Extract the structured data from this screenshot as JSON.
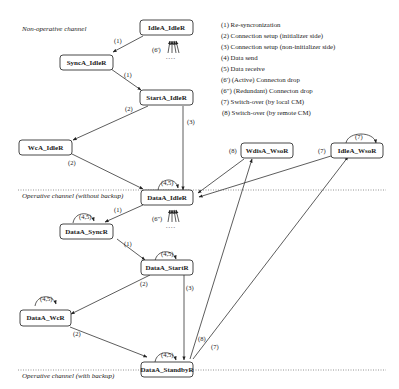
{
  "sections": {
    "non_operative": "Non-operative channel",
    "operative_without_backup": "Operative channel (without backup)",
    "operative_with_backup": "Operative channel  (with backup)"
  },
  "legend": [
    "(1) Re-syncronization",
    "(2) Connection setup (initializer side)",
    "(3) Connection setup  (non-initializer side)",
    "(4) Data send",
    "(5) Data receive",
    "(6') (Active) Connecton drop",
    "(6\") (Redundant) Connecton drop",
    "(7) Switch-over (by local CM)",
    "(8) Switch-over (by remote CM)"
  ],
  "nodes": {
    "idlea_idler": "IdleA_IdleR",
    "synca_idler": "SyncA_IdleR",
    "starta_idler": "StartA_IdleR",
    "wca_idler": "WcA_IdleR",
    "wdisa_wsor": "WdisA_WsoR",
    "idlea_wsor": "IdleA_WsoR",
    "dataa_idler": "DataA_IdleR",
    "dataa_syncr": "DataA_SyncR",
    "dataa_startr": "DataA_StartR",
    "dataa_wcr": "DataA_WcR",
    "dataa_standbyr": "DataA_StandbyR"
  },
  "edge_labels": {
    "idle_to_sync": "(1)",
    "sync_to_start": "(1)",
    "start_to_wc": "(2)",
    "start_to_data": "(3)",
    "wc_to_data": "(2)",
    "drop_active": "(6')",
    "drop_redundant": "(6\")",
    "dataidle_to_syncr": "(1)",
    "syncr_to_startr": "(1)",
    "startr_to_wcr": "(2)",
    "startr_to_standby": "(3)",
    "wcr_to_standby": "(2)",
    "wdis_to_dataidle": "(8)",
    "idlewso_to_dataidle": "(7)",
    "idlewso_self": "(7)",
    "standby_to_wdis": "(8)",
    "standby_to_idlewso": "(7)",
    "loop_dataidle": "(4,5)",
    "loop_syncr": "(4,5)",
    "loop_startr": "(4,5)",
    "loop_wcr": "(4,5)",
    "loop_standby": "(4,5)"
  },
  "dots": "....",
  "colors": {
    "stroke": "#333333",
    "text": "#1a1a1a",
    "background": "#ffffff",
    "divider": "#777777"
  }
}
